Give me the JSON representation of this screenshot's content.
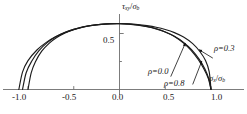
{
  "chart_data": {
    "type": "line",
    "title": "",
    "xlabel": "σx/σb",
    "ylabel": "τxy/σb",
    "xlim": [
      -1.18,
      1.16
    ],
    "ylim": [
      0.0,
      0.68
    ],
    "grid": false,
    "legend_position": "inline-annotations",
    "xticks": [
      -1.0,
      -0.5,
      0.0,
      0.5,
      1.0
    ],
    "xticklabels": [
      "-1.0",
      "-0.5",
      "0.0",
      "0.5",
      "1.0"
    ],
    "yticks": [
      0.5
    ],
    "yticklabels": [
      "0.5"
    ],
    "series": [
      {
        "name": "ρ=0.3",
        "label": "ρ=0.3",
        "color": "#1c1c1c",
        "x": [
          -1.1,
          -1.06,
          -1.0,
          -0.9,
          -0.8,
          -0.7,
          -0.6,
          -0.5,
          -0.4,
          -0.3,
          -0.2,
          -0.1,
          0.0,
          0.1,
          0.2,
          0.3,
          0.4,
          0.5,
          0.6,
          0.7,
          0.8,
          0.88,
          0.94,
          0.98,
          1.0
        ],
        "y": [
          0.0,
          0.155,
          0.258,
          0.355,
          0.421,
          0.47,
          0.508,
          0.537,
          0.558,
          0.573,
          0.582,
          0.587,
          0.588,
          0.586,
          0.58,
          0.57,
          0.556,
          0.536,
          0.508,
          0.468,
          0.409,
          0.337,
          0.258,
          0.16,
          0.0
        ]
      },
      {
        "name": "ρ=0.0",
        "label": "ρ=0.0",
        "color": "#1c1c1c",
        "x": [
          -1.06,
          -1.02,
          -0.96,
          -0.88,
          -0.79,
          -0.7,
          -0.6,
          -0.5,
          -0.4,
          -0.3,
          -0.2,
          -0.1,
          0.0,
          0.1,
          0.2,
          0.3,
          0.4,
          0.5,
          0.6,
          0.7,
          0.78,
          0.86,
          0.92,
          0.97,
          1.0
        ],
        "y": [
          0.0,
          0.15,
          0.252,
          0.347,
          0.418,
          0.468,
          0.508,
          0.537,
          0.559,
          0.574,
          0.583,
          0.588,
          0.589,
          0.585,
          0.576,
          0.562,
          0.542,
          0.514,
          0.474,
          0.415,
          0.351,
          0.268,
          0.188,
          0.1,
          0.0
        ]
      },
      {
        "name": "ρ=0.8",
        "label": "ρ=0.8",
        "color": "#1c1c1c",
        "x": [
          -1.0,
          -0.965,
          -0.92,
          -0.85,
          -0.77,
          -0.69,
          -0.6,
          -0.5,
          -0.4,
          -0.3,
          -0.2,
          -0.1,
          0.0,
          0.1,
          0.2,
          0.3,
          0.4,
          0.5,
          0.6,
          0.7,
          0.79,
          0.87,
          0.935,
          0.98,
          1.0
        ],
        "y": [
          0.0,
          0.148,
          0.246,
          0.342,
          0.412,
          0.462,
          0.503,
          0.534,
          0.556,
          0.571,
          0.581,
          0.586,
          0.587,
          0.584,
          0.575,
          0.561,
          0.541,
          0.513,
          0.475,
          0.421,
          0.354,
          0.271,
          0.18,
          0.085,
          0.0
        ]
      }
    ],
    "annotations": [
      {
        "name": "rho-0-3",
        "text": "ρ=0.3",
        "arrow_from": [
          1.02,
          0.28
        ],
        "arrow_to": [
          0.87,
          0.355
        ]
      },
      {
        "name": "rho-0-0",
        "text": "ρ=0.0",
        "arrow_from": [
          0.56,
          0.115
        ],
        "arrow_to": [
          0.72,
          0.415
        ]
      },
      {
        "name": "rho-0-8",
        "text": "ρ=0.8",
        "arrow_from": [
          0.8,
          0.045
        ],
        "arrow_to": [
          0.9,
          0.255
        ]
      }
    ]
  },
  "axes": {
    "y_label_tau": "τ",
    "y_label_tau_sub": "xy",
    "y_label_sigma": "σ",
    "y_label_sigma_sub": "b",
    "y_label_slash": "/",
    "x_label_sigma": "σ",
    "x_label_sigma_sub": "x",
    "x_label_sigma_den": "σ",
    "x_label_sigma_den_sub": "b",
    "x_label_slash": "/",
    "ytick_0_5": "0.5",
    "xtick_neg1": "-1.0",
    "xtick_neg0_5": "-0.5",
    "xtick_0": "0.0",
    "xtick_0_5": "0.5",
    "xtick_1": "1.0"
  },
  "curve_labels": {
    "rho_0_3": "ρ=0.3",
    "rho_0_0": "ρ=0.0",
    "rho_0_8": "ρ=0.8"
  },
  "colors": {
    "axis": "#6d6d6d",
    "curve": "#1c1c1c",
    "text": "#1a1a1a",
    "background": "#ffffff"
  }
}
